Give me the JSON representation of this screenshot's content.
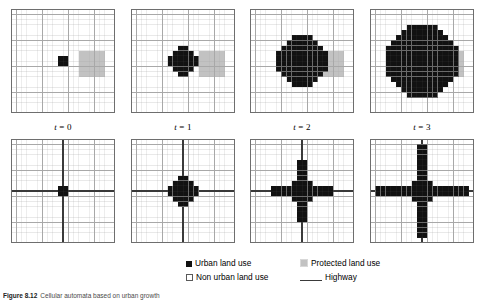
{
  "figure": {
    "width": 483,
    "height": 302,
    "grid_size": 20,
    "colors": {
      "urban": "#111111",
      "non_urban": "#ffffff",
      "protected": "#c2c2c2",
      "highway": "#3a3a3a",
      "gridline": "#a8a8a8",
      "border": "#6e6e6e",
      "background": "#ffffff"
    }
  },
  "panel_labels": [
    {
      "prefix": "t",
      "value": "= 0",
      "full": "t = 0"
    },
    {
      "prefix": "t",
      "value": "= 1",
      "full": "t = 1"
    },
    {
      "prefix": "t",
      "value": "= 2",
      "full": "t = 2"
    },
    {
      "prefix": "t",
      "value": "= 3",
      "full": "t = 3"
    }
  ],
  "legend": {
    "items": [
      {
        "key": "urban",
        "label": "Urban land use",
        "swatch": "urban-square-filled"
      },
      {
        "key": "protected",
        "label": "Protected land use",
        "swatch": "protected-square-gray"
      },
      {
        "key": "non_urban",
        "label": "Non urban land use",
        "swatch": "nonurban-square-outline"
      },
      {
        "key": "highway",
        "label": "Highway",
        "swatch": "highway-line"
      }
    ]
  },
  "caption": {
    "label": "Figure 8.12",
    "text": "Cellular automata based on urban growth"
  },
  "chart_data": {
    "type": "heatmap",
    "grid": {
      "rows": 20,
      "cols": 20
    },
    "legend_entries": [
      "Urban land use",
      "Protected land use",
      "Non urban land use",
      "Highway"
    ],
    "time_steps": [
      "t = 0",
      "t = 1",
      "t = 2",
      "t = 3"
    ],
    "rows": [
      {
        "name": "protected-zone-scenario",
        "has_highway": false,
        "protected_zone": {
          "x0": 13,
          "y0": 8,
          "x1": 17,
          "y1": 12
        },
        "panels": [
          {
            "t": 0,
            "urban_radius": 1,
            "center": [
              9,
              9
            ],
            "urban_cells": [
              [
                9,
                9
              ],
              [
                10,
                9
              ],
              [
                9,
                10
              ],
              [
                10,
                10
              ]
            ]
          },
          {
            "t": 1,
            "urban_radius": 2,
            "center": [
              9,
              9
            ],
            "shape": "octagon"
          },
          {
            "t": 2,
            "urban_radius": 4,
            "center": [
              9,
              9
            ],
            "shape": "octagon"
          },
          {
            "t": 3,
            "urban_radius": 6,
            "center": [
              9,
              9
            ],
            "shape": "octagon"
          }
        ]
      },
      {
        "name": "highway-scenario",
        "has_highway": true,
        "highway": {
          "vertical_col": 10,
          "horizontal_row": 10
        },
        "panels": [
          {
            "t": 0,
            "urban_radius": 1,
            "center": [
              9,
              9
            ],
            "shape": "square",
            "arm": 0
          },
          {
            "t": 1,
            "urban_radius": 2,
            "center": [
              9,
              9
            ],
            "shape": "octagon",
            "arm": 0
          },
          {
            "t": 2,
            "urban_radius": 2,
            "center": [
              9,
              9
            ],
            "shape": "cross",
            "arm": 4
          },
          {
            "t": 3,
            "urban_radius": 2,
            "center": [
              9,
              9
            ],
            "shape": "cross",
            "arm": 7
          }
        ]
      }
    ]
  }
}
